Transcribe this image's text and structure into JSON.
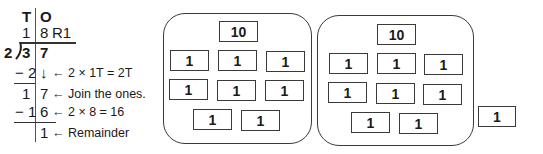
{
  "division": {
    "headers": {
      "tens": "T",
      "ones": "O"
    },
    "quotient": {
      "tens": "1",
      "ones": "8",
      "remainder_label": "R1"
    },
    "divisor": "2",
    "dividend": {
      "tens": "3",
      "ones": "7"
    },
    "steps": [
      {
        "tens": "− 2",
        "ones": "↓",
        "note": "← 2 × 1T = 2T"
      },
      {
        "tens": "1",
        "ones": "7",
        "note": "← Join the ones."
      },
      {
        "tens": "− 1",
        "ones": "6",
        "note": "← 2 × 8 = 16"
      },
      {
        "tens": "",
        "ones": "1",
        "note": "← Remainder"
      }
    ]
  },
  "groups": [
    {
      "ten": "10",
      "ones": [
        "1",
        "1",
        "1",
        "1",
        "1",
        "1",
        "1",
        "1"
      ]
    },
    {
      "ten": "10",
      "ones": [
        "1",
        "1",
        "1",
        "1",
        "1",
        "1",
        "1",
        "1"
      ]
    }
  ],
  "leftover": "1"
}
